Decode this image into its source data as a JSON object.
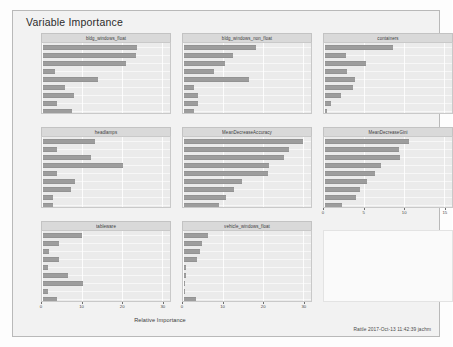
{
  "window": {
    "title": "Variable Importance"
  },
  "axes": {
    "x_title": "Relative Importance",
    "y_variables": [
      "Mg",
      "RI",
      "Al",
      "Ba",
      "Ca",
      "Na",
      "K",
      "Si",
      "Fe"
    ],
    "x_ticks_shared": [
      "0",
      "10",
      "20",
      "30"
    ],
    "x_ticks_gini": [
      "0",
      "5",
      "10",
      "15"
    ]
  },
  "footer": {
    "stamp": "Rattle 2017-Oct-13 11:42:39 jachm"
  },
  "colors": {
    "bar_fill": "#9d9d9d",
    "bar_stroke": "#939393",
    "panel_bg": "#ebebeb",
    "strip_bg": "#d9d9d9",
    "card_bg": "#f2f2f2",
    "gridline": "#ffffff"
  },
  "chart_data": {
    "type": "bar",
    "title": "Variable Importance",
    "xlabel": "Relative Importance",
    "ylabel": "",
    "orientation": "horizontal",
    "grid": true,
    "legend": "none",
    "layout": {
      "rows": 3,
      "cols": 3,
      "facet_strip_position": "top"
    },
    "categories": [
      "Mg",
      "RI",
      "Al",
      "Ba",
      "Ca",
      "Na",
      "K",
      "Si",
      "Fe"
    ],
    "xlim": [
      0,
      32
    ],
    "panels": [
      {
        "name": "bldg_windows_float",
        "xlim": [
          0,
          32
        ],
        "xticks": [
          0,
          10,
          20,
          30
        ],
        "values": [
          23.5,
          23.2,
          20.8,
          2.9,
          13.8,
          5.5,
          7.8,
          3.4,
          7.2
        ]
      },
      {
        "name": "bldg_windows_non_float",
        "xlim": [
          0,
          32
        ],
        "xticks": [
          0,
          10,
          20,
          30
        ],
        "values": [
          18.0,
          12.2,
          10.2,
          7.5,
          16.2,
          2.6,
          3.5,
          3.4,
          2.4
        ]
      },
      {
        "name": "containers",
        "xlim": [
          0,
          32
        ],
        "xticks": [
          0,
          10,
          20,
          30
        ],
        "values": [
          17.1,
          5.2,
          10.2,
          5.4,
          7.5,
          6.9,
          4.1,
          1.4,
          0.6
        ]
      },
      {
        "name": "headlamps",
        "xlim": [
          0,
          32
        ],
        "xticks": [
          0,
          10,
          20,
          30
        ],
        "values": [
          13.0,
          3.4,
          12.1,
          20.0,
          3.5,
          8.0,
          7.0,
          2.5,
          2.6
        ]
      },
      {
        "name": "MeanDecreaseAccuracy",
        "xlim": [
          0,
          32
        ],
        "xticks": [
          0,
          10,
          20,
          30
        ],
        "values": [
          29.8,
          26.3,
          24.9,
          21.2,
          20.9,
          14.5,
          12.6,
          10.4,
          8.8
        ]
      },
      {
        "name": "MeanDecreaseGini",
        "xlim": [
          0,
          16
        ],
        "xticks": [
          0,
          5,
          10,
          15
        ],
        "values": [
          10.5,
          9.2,
          9.4,
          7.0,
          6.3,
          5.2,
          4.4,
          3.9,
          2.1
        ]
      },
      {
        "name": "tableware",
        "xlim": [
          0,
          32
        ],
        "xticks": [
          0,
          10,
          20,
          30
        ],
        "values": [
          9.8,
          4.1,
          1.4,
          4.0,
          1.3,
          6.3,
          9.9,
          1.2,
          3.6
        ]
      },
      {
        "name": "vehicle_windows_float",
        "xlim": [
          0,
          32
        ],
        "xticks": [
          0,
          10,
          20,
          30
        ],
        "values": [
          6.1,
          4.4,
          3.9,
          3.3,
          0.5,
          0.4,
          0.0,
          0.3,
          3.0
        ]
      },
      {
        "name": "",
        "blank": true,
        "values": []
      }
    ]
  }
}
